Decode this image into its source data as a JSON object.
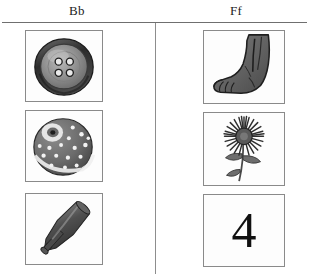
{
  "page": {
    "type": "alphabet-picture-worksheet",
    "background_color": "#ffffff",
    "rule_color": "#6f6f6f",
    "cell_border_color": "#8a8a8a"
  },
  "columns": [
    {
      "id": "bb",
      "heading": "Bb"
    },
    {
      "id": "ff",
      "heading": "Ff"
    }
  ],
  "cells": {
    "bb": [
      {
        "icon": "button-icon",
        "alt": "button with four holes"
      },
      {
        "icon": "ball-icon",
        "alt": "spotted ball"
      },
      {
        "icon": "baseball-bat-icon",
        "alt": "baseball bat"
      }
    ],
    "ff": [
      {
        "icon": "foot-icon",
        "alt": "foot"
      },
      {
        "icon": "flower-icon",
        "alt": "flower"
      },
      {
        "icon": "numeral-four",
        "alt": "four",
        "text": "4"
      }
    ]
  }
}
